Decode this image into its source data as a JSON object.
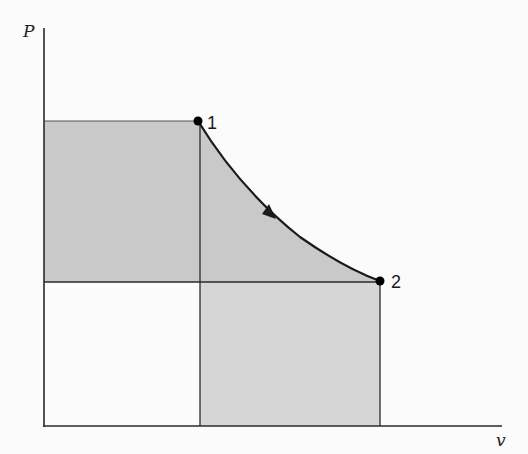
{
  "diagram": {
    "type": "P-v diagram",
    "axes": {
      "y_label": "P",
      "x_label": "v"
    },
    "points": [
      {
        "id": "1",
        "label": "1",
        "x": 198,
        "y": 121
      },
      {
        "id": "2",
        "label": "2",
        "x": 380,
        "y": 281
      }
    ],
    "process": {
      "from": "1",
      "to": "2",
      "shape": "expansion curve",
      "direction": "1 to 2"
    },
    "shaded_regions": [
      {
        "name": "area-under-P1-to-v1",
        "description": "rectangle from origin to point 1"
      },
      {
        "name": "area-under-curve",
        "description": "area under process curve 1-2"
      }
    ],
    "colors": {
      "background": "#fbfbfb",
      "fill_dark": "#c9c9c9",
      "fill_light": "#d6d6d6",
      "line": "#2a2a2a",
      "thin_line": "#555555",
      "point": "#000000"
    }
  }
}
